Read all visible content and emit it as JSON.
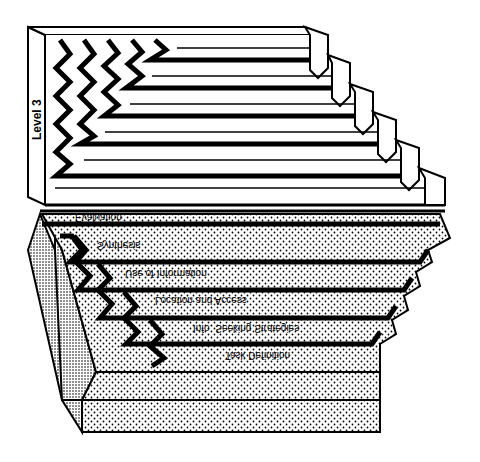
{
  "diagram": {
    "level_label": "Level 3",
    "top_block": {
      "fill": "#ffffff",
      "stroke": "#000000",
      "tiers": 6
    },
    "bottom_block": {
      "mirrored": true,
      "fill_pattern": "dotted",
      "side_pattern": "dense-dotted",
      "labels": [
        "Evaluation",
        "Synthesis",
        "Use of Information",
        "Location and Access",
        "Info. Seeking Strategies",
        "Task Definition"
      ]
    }
  }
}
